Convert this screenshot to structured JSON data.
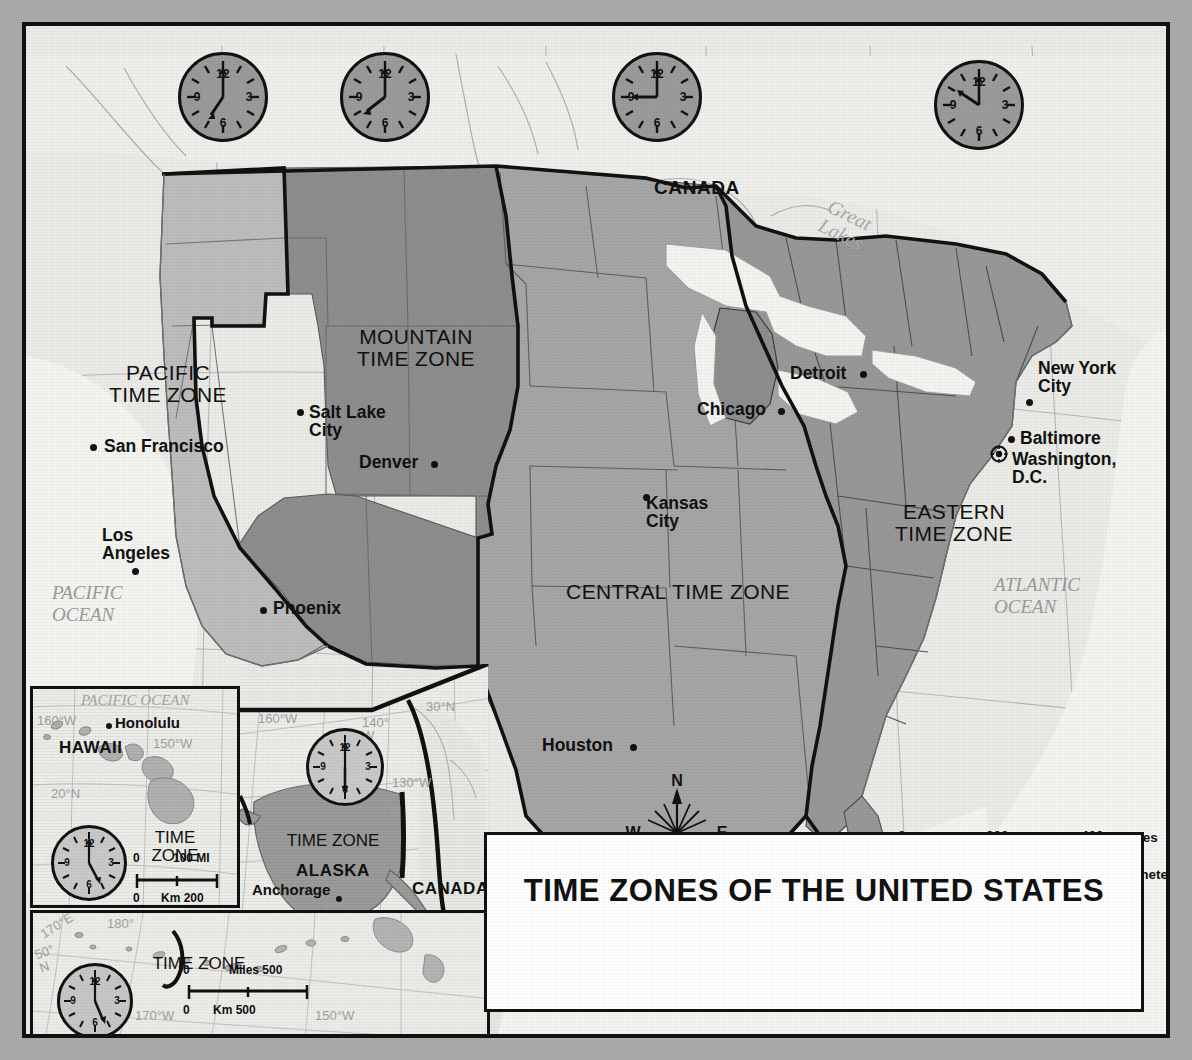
{
  "title": "TIME ZONES OF THE UNITED STATES",
  "zones": [
    {
      "id": "pacific",
      "label": "PACIFIC\nTIME ZONE",
      "clock_time": "8:00",
      "fill": "#bdbdbd"
    },
    {
      "id": "mountain",
      "label": "MOUNTAIN\nTIME ZONE",
      "clock_time": "9:00",
      "fill": "#8e8e8e"
    },
    {
      "id": "central",
      "label": "CENTRAL TIME ZONE",
      "clock_time": "9:00",
      "fill": "#a6a6a6"
    },
    {
      "id": "eastern",
      "label": "EASTERN\nTIME ZONE",
      "clock_time": "11:00",
      "fill": "#989898"
    }
  ],
  "clocks": [
    {
      "name": "pacific-clock",
      "hour": 8,
      "minute": 0,
      "numerals": [
        "12",
        "3",
        "6",
        "9"
      ]
    },
    {
      "name": "mountain-clock",
      "hour": 9,
      "minute": 0,
      "numerals": [
        "12",
        "3",
        "6",
        "9"
      ]
    },
    {
      "name": "central-clock",
      "hour": 9,
      "minute": 0,
      "numerals": [
        "12",
        "3",
        "6",
        "9"
      ]
    },
    {
      "name": "eastern-clock",
      "hour": 11,
      "minute": 0,
      "numerals": [
        "12",
        "3",
        "6",
        "9"
      ]
    },
    {
      "name": "hawaii-clock",
      "hour": 5,
      "minute": 0,
      "numerals": [
        "12",
        "3",
        "6",
        "9"
      ]
    },
    {
      "name": "alaska-clock",
      "hour": 6,
      "minute": 0,
      "numerals": [
        "12",
        "3",
        "6",
        "9"
      ]
    }
  ],
  "cities": [
    {
      "name": "San Francisco",
      "label": "San Francisco"
    },
    {
      "name": "Los Angeles",
      "label": "Los\nAngeles"
    },
    {
      "name": "Phoenix",
      "label": "Phoenix"
    },
    {
      "name": "Salt Lake City",
      "label": "Salt Lake\nCity"
    },
    {
      "name": "Denver",
      "label": "Denver"
    },
    {
      "name": "Kansas City",
      "label": "Kansas\nCity"
    },
    {
      "name": "Houston",
      "label": "Houston"
    },
    {
      "name": "Chicago",
      "label": "Chicago"
    },
    {
      "name": "Detroit",
      "label": "Detroit"
    },
    {
      "name": "New York City",
      "label": "New York\nCity"
    },
    {
      "name": "Baltimore",
      "label": "Baltimore"
    },
    {
      "name": "Washington, D.C.",
      "label": "Washington,\nD.C."
    },
    {
      "name": "Honolulu",
      "label": "Honolulu"
    },
    {
      "name": "Anchorage",
      "label": "Anchorage"
    }
  ],
  "countries": [
    "CANADA",
    "MEXICO"
  ],
  "country_canada": "CANADA",
  "country_mexico": "MEXICO",
  "country_canada_inset": "CANADA",
  "oceans": {
    "pacific": "PACIFIC\nOCEAN",
    "atlantic": "ATLANTIC\nOCEAN",
    "gulf": "Gulf of Mexico",
    "great_lakes": "Great\nLakes",
    "pacific_inset": "PACIFIC OCEAN"
  },
  "graticule": {
    "lon_top": [
      "120°W",
      "110°W",
      "100°W",
      "90°W",
      "80°W",
      "70°W"
    ],
    "lat_left_50n": "50°N",
    "lat_left_40n": "40°N",
    "lon_left_120w": "120°W",
    "lon_left_110w": "110°W",
    "lon_bottom_100w": "100°W",
    "lon_bottom_90w": "90°W",
    "lat_bottom_30n": "30°N",
    "lat_right_50n": "50°N",
    "lat_right_40n": "40°N",
    "lon_right_70w": "70°W",
    "lat_right_30n": "30°N"
  },
  "compass": {
    "n": "N",
    "e": "E",
    "s": "S",
    "w": "W"
  },
  "scale_main": {
    "miles_ticks": [
      "0",
      "200",
      "400"
    ],
    "miles_unit": "Miles",
    "km_ticks": [
      "0",
      "200",
      "400",
      "600"
    ],
    "km_unit": "Kilometers"
  },
  "hawaii_inset": {
    "name": "HAWAII",
    "zone": "TIME\nZONE",
    "city": "Honolulu",
    "ocean": "PACIFIC OCEAN",
    "grat": [
      "160°W",
      "150°W",
      "20°N"
    ],
    "scale": {
      "miles_zero": "0",
      "miles_max": "100 MI",
      "km_zero": "0",
      "km_max": "Km 200"
    }
  },
  "alaska_inset": {
    "name": "ALASKA",
    "zone": "TIME ZONE",
    "city": "Anchorage",
    "country": "CANADA",
    "grat": [
      "160°W",
      "140°\nW",
      "130°W",
      "70°N",
      "60°N",
      "30°N"
    ]
  },
  "aleutian_inset": {
    "zone": "TIME ZONE",
    "grat": [
      "170°E",
      "180°",
      "50°\nN",
      "170°W",
      "150°W"
    ],
    "scale": {
      "miles": "Miles 500",
      "miles_zero": "0",
      "km": "Km 500",
      "km_zero": "0"
    }
  },
  "colors": {
    "pacific": "#bdbdbd",
    "mountain": "#8e8e8e",
    "central": "#a6a6a6",
    "eastern": "#989898",
    "water": "#f2f2ef",
    "land_other": "#efefec",
    "border": "#111111",
    "page": "#a9a9a9"
  }
}
